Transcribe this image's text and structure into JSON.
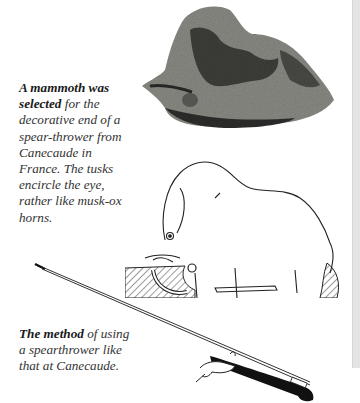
{
  "page": {
    "background": "#ffffff",
    "edge_strip_color": "#e4e4e4"
  },
  "captions": {
    "mammoth": {
      "bold": "A mammoth was selected",
      "rest": " for the decorative end of a spear-thrower from Canecaude in France. The tusks encircle the eye, rather like musk-ox horns."
    },
    "method": {
      "bold": "The method",
      "rest": " of using a spearthrower like that at Canecaude."
    }
  },
  "figures": {
    "photo": {
      "subject": "carved mammoth spear-thrower end (photograph)",
      "icon": "mammoth-photo"
    },
    "drawing": {
      "subject": "line drawing of mammoth carving with tusks encircling eye",
      "icon": "mammoth-drawing"
    },
    "spear": {
      "subject": "hand holding spearthrower with long spear",
      "icon": "spearthrower-illustration"
    }
  }
}
